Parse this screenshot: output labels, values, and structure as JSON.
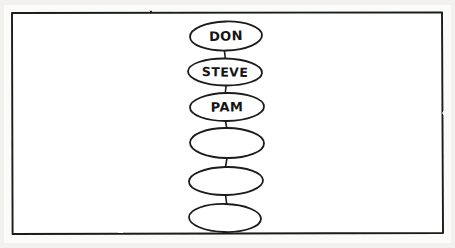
{
  "image": {
    "kind": "hand-drawn-diagram",
    "medium": "ink-on-paper-scan",
    "width": 455,
    "height": 248,
    "paper_color": "#ffffff",
    "margin_color": "#f2f1ef",
    "ink_color": "#1a1a1a"
  },
  "frame": {
    "name": "hand-ruled-border",
    "x": 11,
    "y": 12,
    "width": 432,
    "height": 222,
    "stroke": "#1a1a1a"
  },
  "diagram": {
    "type": "vertical-chain",
    "orientation": "top-to-bottom",
    "node_shape": "ellipse",
    "center_x": 226,
    "node_count": 6,
    "labeled_count": 3,
    "unlabeled_count": 3,
    "connector_style": "short-straight-line",
    "nodes": [
      {
        "index": 1,
        "label": "DON",
        "labeled": true,
        "cx": 226,
        "cy": 36,
        "rx": 36,
        "ry": 14.5,
        "rotation": -1.5
      },
      {
        "index": 2,
        "label": "STEVE",
        "labeled": true,
        "cx": 225,
        "cy": 72,
        "rx": 37,
        "ry": 13.5,
        "rotation": 1.0
      },
      {
        "index": 3,
        "label": "PAM",
        "labeled": true,
        "cx": 227,
        "cy": 107,
        "rx": 37,
        "ry": 14,
        "rotation": -0.8
      },
      {
        "index": 4,
        "label": "",
        "labeled": false,
        "cx": 227,
        "cy": 143,
        "rx": 37,
        "ry": 15,
        "rotation": 0.6
      },
      {
        "index": 5,
        "label": "",
        "labeled": false,
        "cx": 226,
        "cy": 181,
        "rx": 37,
        "ry": 14,
        "rotation": -1.2
      },
      {
        "index": 6,
        "label": "",
        "labeled": false,
        "cx": 225,
        "cy": 218,
        "rx": 36,
        "ry": 14,
        "rotation": 1.4
      }
    ],
    "connectors": [
      {
        "index": 1,
        "from_node": 1,
        "to_node": 2,
        "x1": 224,
        "y1": 50,
        "x2": 226,
        "y2": 59
      },
      {
        "index": 2,
        "from_node": 2,
        "to_node": 3,
        "x1": 226,
        "y1": 86,
        "x2": 225,
        "y2": 93
      },
      {
        "index": 3,
        "from_node": 3,
        "to_node": 4,
        "x1": 225,
        "y1": 121,
        "x2": 227,
        "y2": 128
      },
      {
        "index": 4,
        "from_node": 4,
        "to_node": 5,
        "x1": 227,
        "y1": 158,
        "x2": 225,
        "y2": 167
      },
      {
        "index": 5,
        "from_node": 5,
        "to_node": 6,
        "x1": 225,
        "y1": 195,
        "x2": 227,
        "y2": 204
      }
    ]
  }
}
